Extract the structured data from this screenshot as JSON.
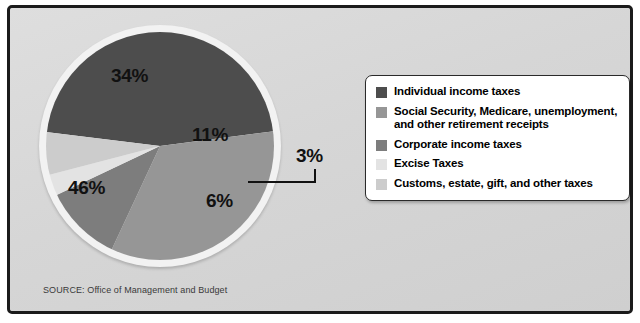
{
  "chart_data": {
    "type": "pie",
    "title": "",
    "categories": [
      "Individual income taxes",
      "Social Security, Medicare, unemployment, and other retirement receipts",
      "Corporate income taxes",
      "Excise Taxes",
      "Customs, estate, gift, and other taxes"
    ],
    "values": [
      46,
      34,
      11,
      3,
      6
    ],
    "value_labels": [
      "46%",
      "34%",
      "11%",
      "3%",
      "6%"
    ],
    "colors": [
      "#4d4d4d",
      "#969696",
      "#7d7d7d",
      "#e3e3e3",
      "#cccccc"
    ],
    "legend_position": "right",
    "grid": false,
    "xlabel": "",
    "ylabel": ""
  },
  "slices": [
    {
      "label": "46%",
      "value": 46,
      "color": "#4d4d4d",
      "name": "Individual income taxes"
    },
    {
      "label": "34%",
      "value": 34,
      "color": "#969696",
      "name": "Social Security, Medicare, unemployment, and other retirement receipts"
    },
    {
      "label": "11%",
      "value": 11,
      "color": "#7d7d7d",
      "name": "Corporate income taxes"
    },
    {
      "label": "3%",
      "value": 3,
      "color": "#e3e3e3",
      "name": "Excise Taxes"
    },
    {
      "label": "6%",
      "value": 6,
      "color": "#cccccc",
      "name": "Customs, estate, gift, and other taxes"
    }
  ],
  "legend": {
    "items": [
      {
        "label": "Individual income taxes",
        "color": "#4d4d4d"
      },
      {
        "label": "Social Security, Medicare, unemployment, and other retirement receipts",
        "color": "#969696"
      },
      {
        "label": "Corporate income taxes",
        "color": "#7d7d7d"
      },
      {
        "label": "Excise Taxes",
        "color": "#e3e3e3"
      },
      {
        "label": "Customs, estate, gift, and other taxes",
        "color": "#cccccc"
      }
    ]
  },
  "source": "SOURCE: Office of Management and Budget",
  "theme": {
    "background": "#d9d9d9",
    "frame_border": "#1b1b1b",
    "legend_background": "#ffffff",
    "legend_border": "#2a2a2a",
    "label_color": "#111111",
    "source_color": "#3a3a3a",
    "pie_halo": "#f2f2f2"
  }
}
